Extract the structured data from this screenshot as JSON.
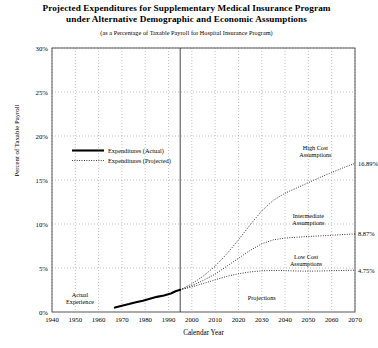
{
  "chart_data": {
    "type": "line",
    "title": "Projected Expenditures for Supplementary Medical Insurance Program under Alternative Demographic and Economic Assumptions",
    "title_line1": "Projected Expenditures for Supplementary Medical Insurance Program",
    "title_line2": "under Alternative Demographic and Economic Assumptions",
    "subtitle": "(as a Percentage of Taxable Payroll for Hospital Insurance Program)",
    "xlabel": "Calendar Year",
    "ylabel": "Percent of Taxable Payroll",
    "xlim": [
      1940,
      2070
    ],
    "ylim": [
      0,
      30
    ],
    "grid": true,
    "xticks": [
      "1940",
      "1950",
      "1960",
      "1970",
      "1980",
      "1990",
      "2000",
      "2010",
      "2020",
      "2030",
      "2040",
      "2050",
      "2060",
      "2070"
    ],
    "yticks": [
      "0%",
      "5%",
      "10%",
      "15%",
      "20%",
      "25%",
      "30%"
    ],
    "legend_position": "upper-left-inside",
    "legend": [
      {
        "label": "Expenditures (Actual)",
        "style": "solid"
      },
      {
        "label": "Expenditures (Projected)",
        "style": "dotted"
      }
    ],
    "era_divider_year": 1995,
    "annotations": [
      {
        "text": "Actual Experience",
        "line1": "Actual",
        "line2": "Experience",
        "x": 1952,
        "y": 1.6
      },
      {
        "text": "Projections",
        "line1": "Projections",
        "line2": "",
        "x": 2030,
        "y": 1.6
      },
      {
        "text": "High Cost Assumptions",
        "line1": "High Cost",
        "line2": "Assumptions",
        "x": 2053,
        "y": 18.3
      },
      {
        "text": "Intermediate Assumptions",
        "line1": "Intermediate",
        "line2": "Assumptions",
        "x": 2050,
        "y": 10.6
      },
      {
        "text": "Low Cost Assumptions",
        "line1": "Low Cost",
        "line2": "Assumptions",
        "x": 2049,
        "y": 5.9
      }
    ],
    "endpoint_labels": [
      {
        "series": "High Cost Assumptions",
        "value": "16.89%",
        "year": 2070,
        "y": 16.89
      },
      {
        "series": "Intermediate Assumptions",
        "value": "8.87%",
        "year": 2070,
        "y": 8.87
      },
      {
        "series": "Low Cost Assumptions",
        "value": "4.75%",
        "year": 2070,
        "y": 4.75
      }
    ],
    "series": [
      {
        "name": "Expenditures (Actual)",
        "style": "solid",
        "x": [
          1967,
          1970,
          1973,
          1976,
          1979,
          1982,
          1985,
          1988,
          1991,
          1993,
          1995
        ],
        "values": [
          0.5,
          0.72,
          0.9,
          1.1,
          1.28,
          1.5,
          1.72,
          1.88,
          2.1,
          2.35,
          2.52
        ]
      },
      {
        "name": "High Cost Assumptions",
        "style": "dotted",
        "x": [
          1995,
          2000,
          2005,
          2010,
          2015,
          2020,
          2025,
          2030,
          2035,
          2040,
          2045,
          2050,
          2055,
          2060,
          2065,
          2070
        ],
        "values": [
          2.52,
          3.2,
          4.1,
          5.2,
          6.6,
          8.2,
          9.9,
          11.5,
          12.7,
          13.5,
          14.1,
          14.7,
          15.3,
          15.85,
          16.4,
          16.89
        ]
      },
      {
        "name": "Intermediate Assumptions",
        "style": "dotted",
        "x": [
          1995,
          2000,
          2005,
          2010,
          2015,
          2020,
          2025,
          2030,
          2035,
          2040,
          2045,
          2050,
          2055,
          2060,
          2065,
          2070
        ],
        "values": [
          2.52,
          3.0,
          3.6,
          4.3,
          5.2,
          6.1,
          7.0,
          7.75,
          8.2,
          8.4,
          8.5,
          8.58,
          8.65,
          8.72,
          8.8,
          8.87
        ]
      },
      {
        "name": "Low Cost Assumptions",
        "style": "dotted",
        "x": [
          1995,
          2000,
          2005,
          2010,
          2015,
          2020,
          2025,
          2030,
          2035,
          2040,
          2045,
          2050,
          2055,
          2060,
          2065,
          2070
        ],
        "values": [
          2.52,
          2.85,
          3.25,
          3.65,
          4.05,
          4.35,
          4.55,
          4.68,
          4.72,
          4.7,
          4.66,
          4.64,
          4.66,
          4.69,
          4.72,
          4.75
        ]
      }
    ]
  }
}
